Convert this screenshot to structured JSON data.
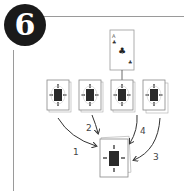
{
  "step": {
    "number": "6"
  },
  "top_card": {
    "rank": "A",
    "suit": "clubs",
    "suit_glyph": "♣"
  },
  "piles": [
    {
      "id": "pile-1",
      "arrow_label": "1"
    },
    {
      "id": "pile-2",
      "arrow_label": "2"
    },
    {
      "id": "pile-3",
      "arrow_label": "4"
    },
    {
      "id": "pile-4",
      "arrow_label": "3"
    }
  ],
  "arrows": [
    {
      "label": "1"
    },
    {
      "label": "2"
    },
    {
      "label": "4"
    },
    {
      "label": "3"
    }
  ],
  "center_stack": {
    "description": "collected pile"
  },
  "colors": {
    "ink": "#1a1a1a",
    "line": "#9a9a9a",
    "card_back_center": "#2a2a2a"
  }
}
